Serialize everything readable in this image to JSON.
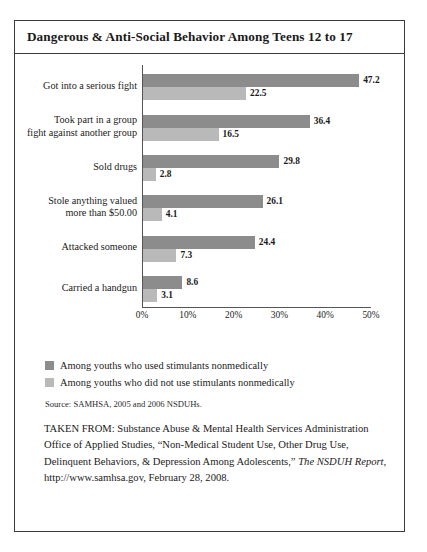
{
  "figure": {
    "title": "Dangerous & Anti-Social Behavior Among Teens 12 to 17",
    "source": "Source: SAMHSA, 2005 and 2006 NSDUHs.",
    "footer": {
      "lead": "TAKEN FROM: Substance Abuse & Mental Health Services Administration Office of Applied Studies, “Non-Medical Student Use, Other Drug Use, Delinquent Behaviors, & Depression Among Adolescents,” ",
      "italic_title": "The NSDUH Report",
      "tail": ", http://www.samhsa.gov, February 28, 2008."
    }
  },
  "chart_data": {
    "type": "bar",
    "orientation": "horizontal",
    "title": "Dangerous & Anti-Social Behavior Among Teens 12 to 17",
    "xlabel": "",
    "ylabel": "",
    "xlim": [
      0,
      50
    ],
    "xticks": [
      0,
      10,
      20,
      30,
      40,
      50
    ],
    "xticklabels": [
      "0%",
      "10%",
      "20%",
      "30%",
      "40%",
      "50%"
    ],
    "grid": false,
    "legend_position": "below",
    "value_labels": true,
    "categories": [
      "Got into a serious fight",
      "Took part in a group fight against another group",
      "Sold drugs",
      "Stole anything valued more than $50.00",
      "Attacked someone",
      "Carried a handgun"
    ],
    "category_lines": [
      [
        "Got into a serious fight"
      ],
      [
        "Took part in a group",
        "fight against another group"
      ],
      [
        "Sold drugs"
      ],
      [
        "Stole anything valued",
        "more than $50.00"
      ],
      [
        "Attacked someone"
      ],
      [
        "Carried a handgun"
      ]
    ],
    "series": [
      {
        "name": "Among youths who used stimulants nonmedically",
        "color": "#8c8c8c",
        "values": [
          47.2,
          36.4,
          29.8,
          26.1,
          24.4,
          8.6
        ]
      },
      {
        "name": "Among youths who did not use stimulants nonmedically",
        "color": "#b9b9b9",
        "values": [
          22.5,
          16.5,
          2.8,
          4.1,
          7.3,
          3.1
        ]
      }
    ]
  }
}
